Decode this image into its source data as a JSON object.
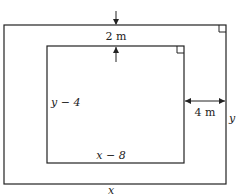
{
  "diagram": {
    "top_gap_label": "2 m",
    "side_gap_label": "4 m",
    "inner_height_label": "y − 4",
    "inner_width_label": "x − 8",
    "outer_height_label": "y",
    "outer_width_label": "x"
  }
}
